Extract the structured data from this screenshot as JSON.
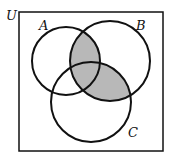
{
  "diagram": {
    "type": "venn",
    "universe_label": "U",
    "sets": [
      {
        "label": "A",
        "cx": 66,
        "cy": 61,
        "r": 34
      },
      {
        "label": "B",
        "cx": 110,
        "cy": 61,
        "r": 40
      },
      {
        "label": "C",
        "cx": 91,
        "cy": 102,
        "r": 40
      }
    ],
    "shaded_regions": [
      "A∩B",
      "B∩C"
    ],
    "shade_color": "#9a9a9a",
    "stroke_color": "#111111"
  }
}
